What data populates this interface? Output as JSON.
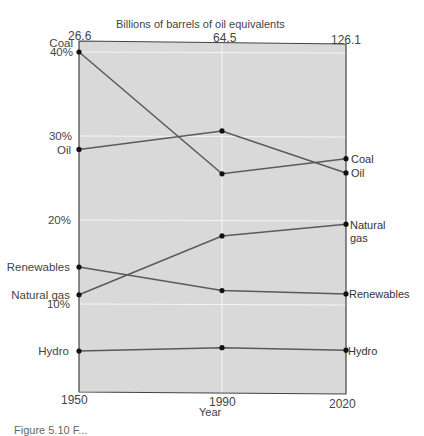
{
  "chart_data": {
    "type": "line",
    "title": "",
    "top_axis": {
      "label": "Billions of barrels of oil equivalents",
      "ticks": [
        {
          "x": 1950,
          "label": "26.6"
        },
        {
          "x": 1990,
          "label": "64.5"
        },
        {
          "x": 2020,
          "label": "126.1"
        }
      ]
    },
    "xlabel": "Year",
    "ylabel": "",
    "x": [
      1950,
      1990,
      2020
    ],
    "x_tick_labels": [
      "1950",
      "1990",
      "2020"
    ],
    "y_tick_labels": [
      "10%",
      "20%",
      "30%",
      "40%"
    ],
    "ylim": [
      1,
      42
    ],
    "grid": true,
    "legend": "inline labels at line ends",
    "series": [
      {
        "name": "Coal",
        "values": [
          40.0,
          25.5,
          27.3
        ]
      },
      {
        "name": "Oil",
        "values": [
          28.4,
          30.6,
          25.6
        ]
      },
      {
        "name": "Natural gas",
        "values": [
          11.1,
          18.1,
          19.5
        ]
      },
      {
        "name": "Renewables",
        "values": [
          14.4,
          11.6,
          11.2
        ]
      },
      {
        "name": "Hydro",
        "values": [
          4.4,
          4.8,
          4.5
        ]
      }
    ]
  },
  "labels": {
    "top_title": "Billions of barrels of oil equivalents",
    "top_ticks": [
      "26.6",
      "64.5",
      "126.1"
    ],
    "y_ticks": {
      "y40": "40%",
      "y30": "30%",
      "y20": "20%",
      "y10": "10%"
    },
    "left": {
      "coal": "Coal",
      "oil": "Oil",
      "renewables": "Renewables",
      "natural_gas": "Natural gas",
      "hydro": "Hydro"
    },
    "right": {
      "coal": "Coal",
      "oil": "Oil",
      "natural_gas_1": "Natural",
      "natural_gas_2": "gas",
      "renewables": "Renewables",
      "hydro": "Hydro"
    },
    "x_ticks": [
      "1950",
      "1990",
      "2020"
    ],
    "xlabel": "Year",
    "caption": "Figure 5.10  F..."
  },
  "colors": {
    "plot_bg": "#d9d9d9",
    "grid": "#f4f4f4",
    "line": "#5a5a5a",
    "frame": "#444444",
    "marker": "#111111"
  }
}
